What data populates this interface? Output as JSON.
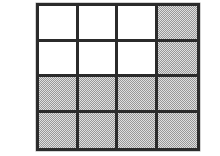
{
  "figure": {
    "title": "Shaded area grid model",
    "type": "grid-area-model",
    "rows": 4,
    "columns": 4,
    "total_cells": 16,
    "shaded_cells": 10,
    "unshaded_cells": 6,
    "fraction_shaded": "10/16",
    "colors": {
      "background": "#ffffff",
      "grid_line": "#2b2b2b",
      "cell_unshaded": "#ffffff",
      "cell_shaded": "#b2b2b2"
    },
    "cells": [
      {
        "row": 1,
        "col": 1,
        "state": "unshaded"
      },
      {
        "row": 1,
        "col": 2,
        "state": "unshaded"
      },
      {
        "row": 1,
        "col": 3,
        "state": "unshaded"
      },
      {
        "row": 1,
        "col": 4,
        "state": "shaded"
      },
      {
        "row": 2,
        "col": 1,
        "state": "unshaded"
      },
      {
        "row": 2,
        "col": 2,
        "state": "unshaded"
      },
      {
        "row": 2,
        "col": 3,
        "state": "unshaded"
      },
      {
        "row": 2,
        "col": 4,
        "state": "shaded"
      },
      {
        "row": 3,
        "col": 1,
        "state": "shaded"
      },
      {
        "row": 3,
        "col": 2,
        "state": "shaded"
      },
      {
        "row": 3,
        "col": 3,
        "state": "shaded"
      },
      {
        "row": 3,
        "col": 4,
        "state": "shaded"
      },
      {
        "row": 4,
        "col": 1,
        "state": "shaded"
      },
      {
        "row": 4,
        "col": 2,
        "state": "shaded"
      },
      {
        "row": 4,
        "col": 3,
        "state": "shaded"
      },
      {
        "row": 4,
        "col": 4,
        "state": "shaded"
      }
    ]
  }
}
